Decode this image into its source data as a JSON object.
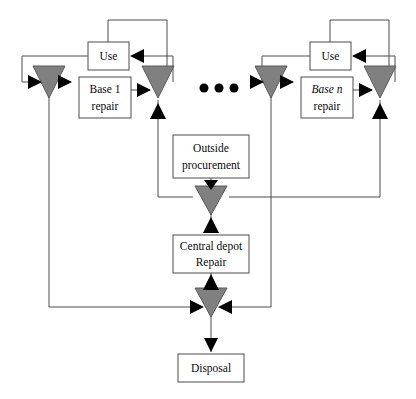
{
  "diagram": {
    "canvas": {
      "width": 416,
      "height": 399
    },
    "colors": {
      "box_fill": "#ffffff",
      "box_stroke": "#4d4d4d",
      "line": "#4d4d4d",
      "triangle_fill": "#808080",
      "triangle_stroke": "#595959",
      "arrowhead": "#000000",
      "text": "#0a0a0a",
      "background": "#ffffff"
    },
    "nodes": [
      {
        "id": "use-1",
        "label": "Use",
        "x": 88,
        "y": 42,
        "w": 41,
        "h": 28
      },
      {
        "id": "base-1",
        "label_line1": "Base 1",
        "label_line2": "repair",
        "x": 79,
        "y": 77,
        "w": 52,
        "h": 41
      },
      {
        "id": "use-n",
        "label": "Use",
        "x": 310,
        "y": 42,
        "w": 41,
        "h": 28
      },
      {
        "id": "base-n",
        "label_line1": "Base n",
        "label_line2": "repair",
        "x": 301,
        "y": 77,
        "w": 52,
        "h": 41
      },
      {
        "id": "outside",
        "label_line1": "Outside",
        "label_line2": "procurement",
        "x": 173,
        "y": 135,
        "w": 76,
        "h": 43
      },
      {
        "id": "central",
        "label_line1": "Central depot",
        "label_line2": "Repair",
        "x": 173,
        "y": 235,
        "w": 76,
        "h": 38
      },
      {
        "id": "disposal",
        "label": "Disposal",
        "x": 178,
        "y": 354,
        "w": 66,
        "h": 28
      }
    ],
    "stock_triangles": [
      {
        "id": "base-1-stock-in",
        "cx": 49,
        "cy": 82,
        "size": 19
      },
      {
        "id": "base-1-stock-out",
        "cx": 158,
        "cy": 82,
        "size": 19
      },
      {
        "id": "base-n-stock-in",
        "cx": 271,
        "cy": 82,
        "size": 19
      },
      {
        "id": "base-n-stock-out",
        "cx": 380,
        "cy": 82,
        "size": 19
      },
      {
        "id": "depot-stock-in",
        "cx": 211,
        "cy": 197,
        "size": 19
      },
      {
        "id": "depot-stock-out",
        "cx": 211,
        "cy": 297,
        "size": 19
      }
    ],
    "ellipsis": {
      "label": "three-dots-ellipsis",
      "dots": [
        {
          "cx": 204,
          "cy": 88
        },
        {
          "cx": 219,
          "cy": 88
        },
        {
          "cx": 234,
          "cy": 88
        }
      ],
      "radius": 4.5
    },
    "labels": {
      "use": "Use",
      "base_first": "Base 1",
      "base_nth": "Base n",
      "repair": "repair",
      "outside_procurement_l1": "Outside",
      "outside_procurement_l2": "procurement",
      "central_depot_l1": "Central depot",
      "central_depot_l2": "Repair",
      "disposal": "Disposal"
    },
    "flows": [
      {
        "from": "base-1-stock-in",
        "to": "base-1",
        "type": "supply"
      },
      {
        "from": "base-1",
        "to": "base-1-stock-out",
        "type": "repaired-return"
      },
      {
        "from": "base-1-stock-out",
        "to": "use-1",
        "type": "issue"
      },
      {
        "from": "use-1",
        "to": "base-1-stock-in",
        "type": "failed-return"
      },
      {
        "from": "base-n-stock-in",
        "to": "base-n",
        "type": "supply"
      },
      {
        "from": "base-n",
        "to": "base-n-stock-out",
        "type": "repaired-return"
      },
      {
        "from": "base-n-stock-out",
        "to": "use-n",
        "type": "issue"
      },
      {
        "from": "use-n",
        "to": "base-n-stock-in",
        "type": "failed-return"
      },
      {
        "from": "outside",
        "to": "depot-stock-in",
        "type": "procurement"
      },
      {
        "from": "depot-stock-in",
        "to": "central",
        "type": "depot-input"
      },
      {
        "from": "central",
        "to": "depot-stock-out",
        "type": "depot-output"
      },
      {
        "from": "depot-stock-out",
        "to": "disposal",
        "type": "condemnation"
      },
      {
        "from": "depot-stock-in",
        "to": "base-1-stock-out",
        "type": "depot-to-base"
      },
      {
        "from": "depot-stock-in",
        "to": "base-n-stock-out",
        "type": "depot-to-base"
      },
      {
        "from": "base-1-stock-in",
        "to": "depot-stock-out",
        "type": "base-to-depot"
      },
      {
        "from": "base-n-stock-in",
        "to": "depot-stock-out",
        "type": "base-to-depot"
      }
    ]
  }
}
